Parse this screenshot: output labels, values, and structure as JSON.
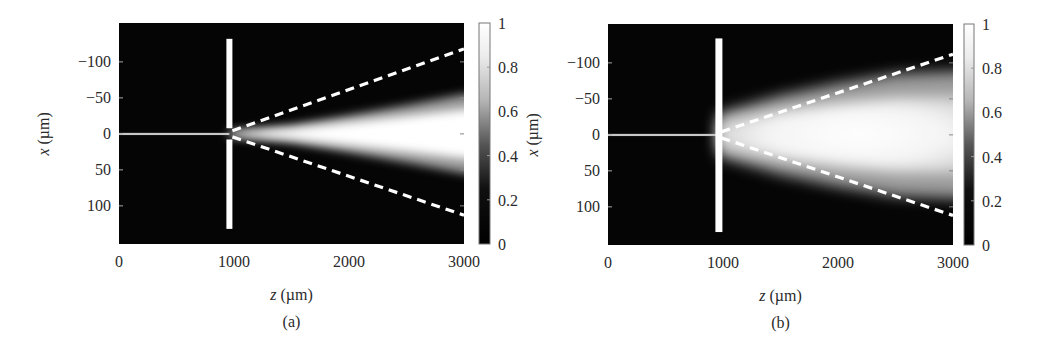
{
  "figure": {
    "background": "#ffffff",
    "plot_background": "#050505",
    "dash_color": "#ffffff"
  },
  "chart_data": [
    {
      "type": "heatmap",
      "panel_label": "(a)",
      "title": "",
      "xlabel": "z (µm)",
      "xlabel_italic": "z",
      "xlabel_unit": "(µm)",
      "ylabel": "x (µm)",
      "ylabel_italic": "x",
      "ylabel_unit": "(µm)",
      "xlim": [
        0,
        3000
      ],
      "ylim": [
        -154,
        153
      ],
      "y_inverted": true,
      "xticks": [
        0,
        1000,
        2000,
        3000
      ],
      "xtick_labels": [
        "0",
        "1000",
        "2000",
        "3000"
      ],
      "yticks": [
        -100,
        -50,
        0,
        50,
        100
      ],
      "ytick_labels": [
        "−100",
        "−50",
        "0",
        "50",
        "100"
      ],
      "colorbar": {
        "range": [
          0,
          1
        ],
        "ticks": [
          "0",
          "0.2",
          "0.4",
          "0.6",
          "0.8",
          "1"
        ],
        "colormap": "gray"
      },
      "grid": false,
      "slit": {
        "z": 960,
        "x_extent": [
          -132,
          132
        ],
        "aperture": [
          -5,
          5
        ],
        "has_gap": true
      },
      "incident_beam": {
        "z_range": [
          0,
          960
        ],
        "x": 0,
        "intensity": 0.8
      },
      "transmitted_beam": {
        "z_start": 960,
        "half_width_at_end": [
          [
            960,
            3
          ],
          [
            1500,
            12
          ],
          [
            2000,
            26
          ],
          [
            2500,
            40
          ],
          [
            3000,
            55
          ]
        ],
        "peak_intensity": 1.0
      },
      "dashed_lines": [
        {
          "from": [
            960,
            0
          ],
          "to": [
            3000,
            -118
          ]
        },
        {
          "from": [
            960,
            0
          ],
          "to": [
            3000,
            113
          ]
        }
      ]
    },
    {
      "type": "heatmap",
      "panel_label": "(b)",
      "title": "",
      "xlabel": "z (µm)",
      "xlabel_italic": "z",
      "xlabel_unit": "(µm)",
      "ylabel": "x (µm)",
      "ylabel_italic": "x",
      "ylabel_unit": "(µm)",
      "xlim": [
        0,
        3000
      ],
      "ylim": [
        -154,
        153
      ],
      "y_inverted": true,
      "xticks": [
        0,
        1000,
        2000,
        3000
      ],
      "xtick_labels": [
        "0",
        "1000",
        "2000",
        "3000"
      ],
      "yticks": [
        -100,
        -50,
        0,
        50,
        100
      ],
      "ytick_labels": [
        "−100",
        "−50",
        "0",
        "50",
        "100"
      ],
      "colorbar": {
        "range": [
          0,
          1
        ],
        "ticks": [
          "0",
          "0.2",
          "0.4",
          "0.6",
          "0.8",
          "1"
        ],
        "colormap": "gray"
      },
      "grid": false,
      "slit": {
        "z": 960,
        "x_extent": [
          -134,
          135
        ],
        "aperture": [
          -5,
          5
        ],
        "has_gap": false
      },
      "incident_beam": {
        "z_range": [
          0,
          960
        ],
        "x": 0,
        "intensity": 0.8
      },
      "transmitted_beam": {
        "z_start": 960,
        "half_width_at_end": [
          [
            960,
            30
          ],
          [
            1500,
            55
          ],
          [
            2000,
            72
          ],
          [
            2500,
            85
          ],
          [
            3000,
            88
          ]
        ],
        "peak_intensity": 1.0
      },
      "dashed_lines": [
        {
          "from": [
            960,
            0
          ],
          "to": [
            3000,
            -112
          ]
        },
        {
          "from": [
            960,
            0
          ],
          "to": [
            3000,
            112
          ]
        }
      ]
    }
  ]
}
